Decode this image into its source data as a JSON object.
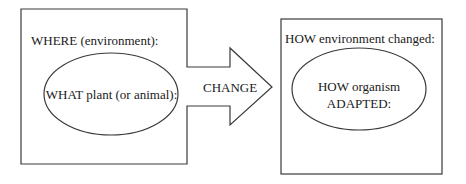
{
  "diagram": {
    "left_box": {
      "heading": "WHERE (environment):",
      "ellipse_label": "WHAT plant (or animal):"
    },
    "arrow": {
      "label": "CHANGE"
    },
    "right_box": {
      "heading": "HOW environment changed:",
      "ellipse_label_line1": "HOW organism",
      "ellipse_label_line2": "ADAPTED:"
    }
  },
  "colors": {
    "stroke": "#3a3a3a",
    "text": "#1a1a1a",
    "background": "#ffffff"
  }
}
